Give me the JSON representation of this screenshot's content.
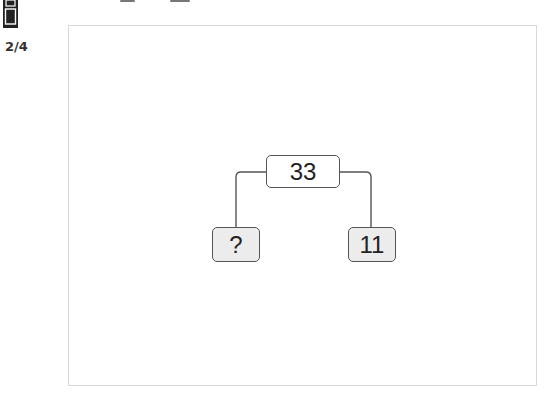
{
  "header": {
    "page_icon": "page-layout-icon",
    "page_counter": "2/4"
  },
  "diagram": {
    "type": "number-bond-tree",
    "root": {
      "label": "33"
    },
    "children": [
      {
        "label": "?",
        "position": "left"
      },
      {
        "label": "11",
        "position": "right"
      }
    ],
    "colors": {
      "root_fill": "#ffffff",
      "leaf_fill": "#ececec",
      "stroke": "#555555"
    }
  }
}
